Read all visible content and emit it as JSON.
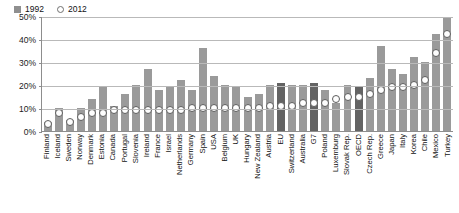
{
  "chart_data": {
    "type": "bar",
    "title": "",
    "xlabel": "",
    "ylabel": "",
    "ylim": [
      0,
      50
    ],
    "yticks": [
      0,
      10,
      20,
      30,
      40,
      50
    ],
    "ytick_labels": [
      "0%",
      "10%",
      "20%",
      "30%",
      "40%",
      "50%"
    ],
    "grid": true,
    "legend_position": "top-left-inside",
    "categories": [
      "Finland",
      "Iceland",
      "Sweden",
      "Norway",
      "Denmark",
      "Estonia",
      "Canada",
      "Portugal",
      "Slovenia",
      "Ireland",
      "France",
      "Israel",
      "Netherlands",
      "Germany",
      "Spain",
      "USA",
      "Belgium",
      "UK",
      "Hungary",
      "New Zealand",
      "Austria",
      "EU",
      "Switzerland",
      "Australia",
      "G7",
      "Poland",
      "Luxemburg",
      "Slovak Rep.",
      "OECD",
      "Czech Rep.",
      "Greece",
      "Japan",
      "Italy",
      "Korea",
      "Chile",
      "Mexico",
      "Turkey"
    ],
    "aggregate_categories": [
      "EU",
      "G7",
      "OECD"
    ],
    "series": [
      {
        "name": "1992",
        "marker": "bar",
        "color": "#9a9a9a",
        "values": [
          4,
          10,
          5,
          10,
          14,
          19,
          11,
          16,
          20,
          27,
          18,
          19,
          22,
          18,
          36,
          24,
          20,
          19,
          15,
          16,
          20,
          21,
          20,
          20,
          21,
          18,
          12,
          20,
          19,
          23,
          37,
          27,
          25,
          32,
          30,
          42,
          49
        ]
      },
      {
        "name": "2012",
        "marker": "circle-open",
        "color": "#ffffff",
        "values": [
          3,
          8,
          4,
          6,
          8,
          8,
          9,
          9,
          9,
          9,
          9,
          9,
          9,
          10,
          10,
          10,
          10,
          10,
          10,
          10,
          11,
          11,
          11,
          12,
          12,
          12,
          14,
          15,
          15,
          16,
          18,
          19,
          19,
          20,
          22,
          34,
          42
        ]
      }
    ]
  },
  "legend": {
    "items": [
      {
        "label": "1992",
        "marker": "square"
      },
      {
        "label": "2012",
        "marker": "circle"
      }
    ]
  }
}
